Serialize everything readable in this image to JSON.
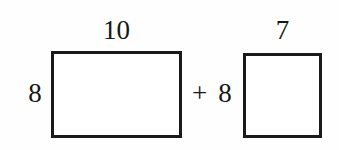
{
  "figure": {
    "background_color": "#fefefe",
    "stroke_color": "#1a1a1a",
    "text_color": "#161616",
    "expression": "10 x 8 + 7 x 8"
  },
  "shapes": [
    {
      "name": "rectangle-1",
      "kind": "rectangle",
      "top_label": "10",
      "left_label": "8",
      "width_units": 10,
      "height_units": 8,
      "filled": false
    },
    {
      "name": "rectangle-2",
      "kind": "square",
      "top_label": "7",
      "left_label": "8",
      "width_units": 7,
      "height_units": 8,
      "filled": false
    }
  ],
  "operator": {
    "symbol": "+",
    "name": "plus"
  }
}
